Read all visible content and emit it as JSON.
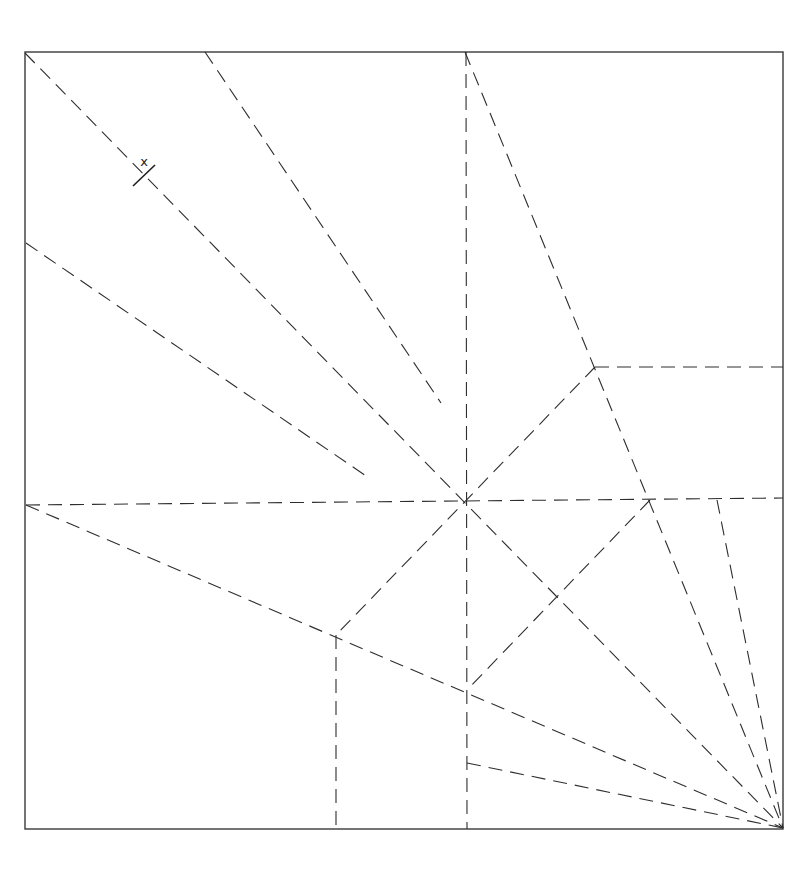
{
  "diagram": {
    "type": "origami crease pattern",
    "canvas": {
      "width": 800,
      "height": 872
    },
    "square": {
      "x1": 25,
      "y1": 52,
      "x2": 783,
      "y2": 829
    },
    "colors": {
      "line": "#2e2e2e",
      "background": "#ffffff"
    },
    "annotation": {
      "label": "x",
      "label_pos": [
        144,
        166
      ],
      "tick": [
        [
          133,
          186
        ],
        [
          155,
          165
        ]
      ]
    },
    "creases": [
      {
        "id": "main-diagonal",
        "from": [
          25,
          53
        ],
        "to": [
          783,
          828
        ]
      },
      {
        "id": "top-steep-diagonal",
        "from": [
          465,
          52
        ],
        "to": [
          783,
          828
        ]
      },
      {
        "id": "center-vertical",
        "from": [
          466,
          52
        ],
        "to": [
          467,
          829
        ]
      },
      {
        "id": "short-diagonal-top",
        "from": [
          205,
          52
        ],
        "to": [
          441,
          403
        ]
      },
      {
        "id": "short-diagonal-left",
        "from": [
          26,
          243
        ],
        "to": [
          369,
          478
        ]
      },
      {
        "id": "horizontal-middle",
        "from": [
          26,
          505
        ],
        "to": [
          783,
          498
        ]
      },
      {
        "id": "horizontal-upper-right",
        "from": [
          595,
          367
        ],
        "to": [
          783,
          367
        ]
      },
      {
        "id": "anti-diagonal-center",
        "from": [
          595,
          367
        ],
        "to": [
          336,
          635
        ]
      },
      {
        "id": "anti-diagonal-lower",
        "from": [
          650,
          500
        ],
        "to": [
          467,
          690
        ]
      },
      {
        "id": "left-to-corner",
        "from": [
          26,
          505
        ],
        "to": [
          783,
          828
        ]
      },
      {
        "id": "vertical-lower-left",
        "from": [
          336,
          635
        ],
        "to": [
          336,
          829
        ]
      },
      {
        "id": "lower-to-corner",
        "from": [
          467,
          763
        ],
        "to": [
          783,
          828
        ]
      },
      {
        "id": "right-steep-to-corner",
        "from": [
          717,
          500
        ],
        "to": [
          783,
          828
        ]
      }
    ]
  }
}
